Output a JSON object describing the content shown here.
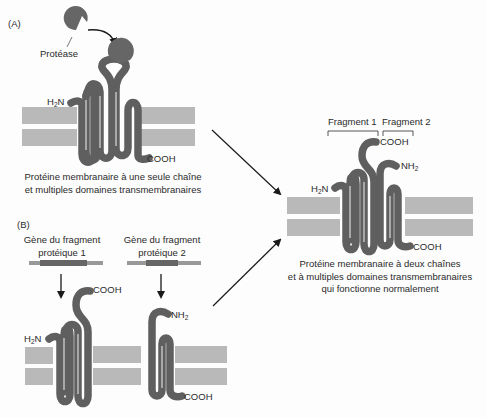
{
  "panels": {
    "a": {
      "label": "(A)",
      "enzyme_label": "Protéase",
      "n_terminus": "H₂N",
      "c_terminus": "COOH",
      "caption_line1": "Protéine membranaire à une seule chaîne",
      "caption_line2": "et multiples domaines transmembranaires"
    },
    "b": {
      "label": "(B)",
      "gene1_line1": "Gène du fragment",
      "gene1_line2": "protéique 1",
      "gene2_line1": "Gène du fragment",
      "gene2_line2": "protéique 2",
      "frag1_n": "H₂N",
      "frag1_c": "COOH",
      "frag2_n": "NH₂",
      "frag2_c": "COOH"
    },
    "result": {
      "fragment1_label": "Fragment 1",
      "fragment2_label": "Fragment 2",
      "n_terminus_1": "H₂N",
      "c_terminus_1": "COOH",
      "n_terminus_2": "NH₂",
      "c_terminus_2": "COOH",
      "caption_line1": "Protéine membranaire à deux chaînes",
      "caption_line2": "et à multiples domaines transmembranaires",
      "caption_line3": "qui fonctionne normalement"
    }
  },
  "colors": {
    "protein": "#5f5f5f",
    "membrane": "#b9b9b9",
    "gene_bar": "#999999",
    "gene_exon": "#666666",
    "arrow": "#1a1a1a"
  }
}
